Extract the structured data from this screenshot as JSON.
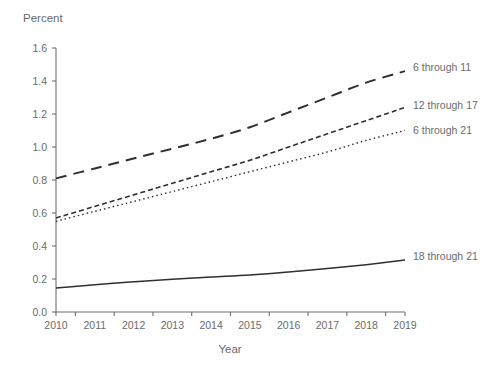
{
  "chart_data": {
    "type": "line",
    "title": "",
    "xlabel": "Year",
    "ylabel": "Percent",
    "x": [
      2010,
      2011,
      2012,
      2013,
      2014,
      2015,
      2016,
      2017,
      2018,
      2019
    ],
    "xtick_labels": [
      "2010",
      "2011",
      "2012",
      "2013",
      "2014",
      "2015",
      "2016",
      "2017",
      "2018",
      "2019"
    ],
    "ytick_labels": [
      "0.0",
      "0.2",
      "0.4",
      "0.6",
      "0.8",
      "1.0",
      "1.2",
      "1.4",
      "1.6"
    ],
    "ytick_values": [
      0.0,
      0.2,
      0.4,
      0.6,
      0.8,
      1.0,
      1.2,
      1.4,
      1.6
    ],
    "xlim": [
      2010,
      2019
    ],
    "ylim": [
      0.0,
      1.6
    ],
    "grid": false,
    "legend_position": "right-inline-labels",
    "series": [
      {
        "name": "6 through 11",
        "label": "6 through 11",
        "style": "long-dash",
        "color": "#2f2f2f",
        "width": 2.0,
        "dasharray": "11,7",
        "values": [
          0.81,
          0.87,
          0.93,
          0.99,
          1.05,
          1.12,
          1.21,
          1.3,
          1.39,
          1.46
        ]
      },
      {
        "name": "12 through 17",
        "label": "12 through 17",
        "style": "short-dash",
        "color": "#2f2f2f",
        "width": 1.6,
        "dasharray": "5,3",
        "values": [
          0.57,
          0.64,
          0.71,
          0.78,
          0.85,
          0.92,
          1.0,
          1.08,
          1.16,
          1.24
        ]
      },
      {
        "name": "6 through 21",
        "label": "6 through 21",
        "style": "dotted",
        "color": "#4a4a4a",
        "width": 1.4,
        "dasharray": "1.5,3",
        "values": [
          0.55,
          0.61,
          0.67,
          0.73,
          0.79,
          0.85,
          0.91,
          0.97,
          1.04,
          1.1
        ]
      },
      {
        "name": "18 through 21",
        "label": "18 through 21",
        "style": "solid",
        "color": "#3d3d3d",
        "width": 1.5,
        "dasharray": "",
        "values": [
          0.145,
          0.165,
          0.183,
          0.198,
          0.212,
          0.225,
          0.243,
          0.263,
          0.287,
          0.315
        ]
      }
    ]
  },
  "axes": {
    "y_axis_title": "Percent",
    "x_axis_title": "Year"
  }
}
